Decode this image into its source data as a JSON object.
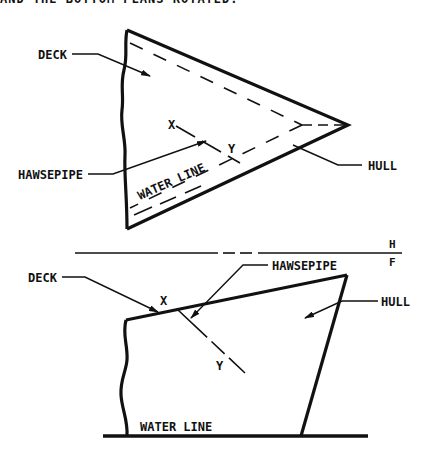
{
  "header": {
    "clipped_text": "AND THE BOTTOM PLANS ROTATED."
  },
  "top_view": {
    "labels": {
      "deck": "DECK",
      "x": "X",
      "y": "Y",
      "hawsepipe": "HAWSEPIPE",
      "water_line": "WATER LINE",
      "hull": "HULL"
    }
  },
  "fold_line": {
    "upper": "H",
    "lower": "F"
  },
  "front_view": {
    "labels": {
      "deck": "DECK",
      "x": "X",
      "y": "Y",
      "hawsepipe": "HAWSEPIPE",
      "hull": "HULL",
      "water_line": "WATER LINE"
    }
  },
  "colors": {
    "ink": "#111111",
    "background": "#ffffff"
  }
}
